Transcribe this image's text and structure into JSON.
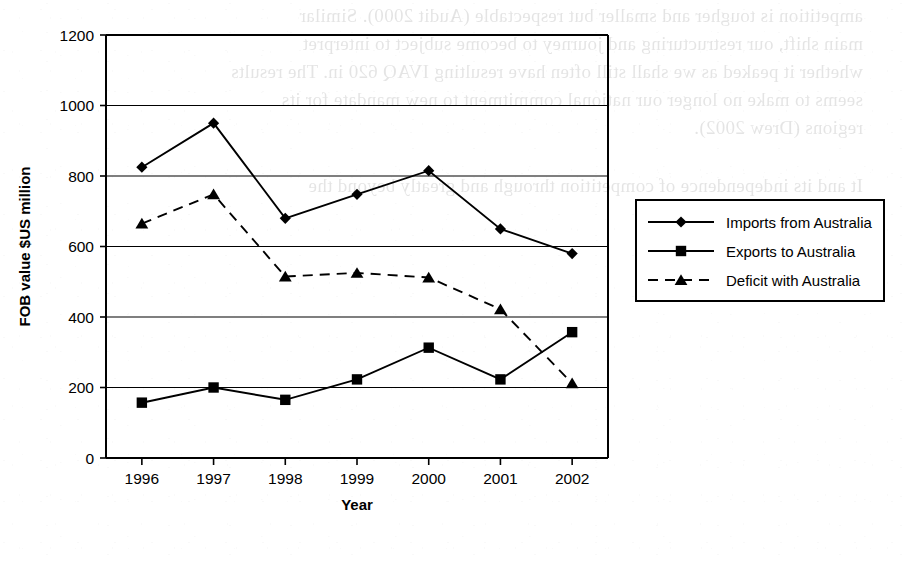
{
  "page": {
    "kind": "scanned-book-page-figure",
    "bleed_through_lines": [
      "ampetition is tougher and smaller but respectable (Audit 2000). Similar",
      "main shift, our restructuring and journey to become subject to interpret",
      "whether it peaked as we shall still often have resulting IVAQ 620 in. The results",
      "seems to make no longer our national commitment to new mandate for its",
      "regions (Drew 2002).",
      "It and its independence of competition through and greatly beyond the"
    ]
  },
  "chart_data": {
    "type": "line",
    "title": "",
    "xlabel": "Year",
    "ylabel": "FOB value $US million",
    "categories": [
      "1996",
      "1997",
      "1998",
      "1999",
      "2000",
      "2001",
      "2002"
    ],
    "ylim": [
      0,
      1200
    ],
    "ytick_step": 200,
    "yticks": [
      "0",
      "200",
      "400",
      "600",
      "800",
      "1000",
      "1200"
    ],
    "grid": "horizontal",
    "legend_position": "right",
    "series": [
      {
        "name": "Imports from Australia",
        "marker": "diamond",
        "line_style": "solid",
        "color": "#000000",
        "values": [
          825,
          950,
          680,
          748,
          815,
          650,
          580
        ]
      },
      {
        "name": "Exports to Australia",
        "marker": "square",
        "line_style": "solid",
        "color": "#000000",
        "values": [
          157,
          200,
          165,
          223,
          313,
          223,
          357
        ]
      },
      {
        "name": "Deficit with Australia",
        "marker": "triangle",
        "line_style": "dashed",
        "color": "#000000",
        "values": [
          665,
          748,
          515,
          525,
          512,
          422,
          212
        ]
      }
    ]
  }
}
